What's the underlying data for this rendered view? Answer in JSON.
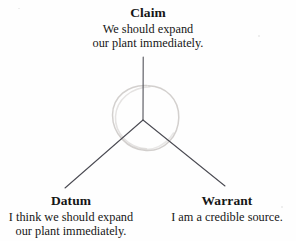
{
  "diagram": {
    "type": "three-branch-junction",
    "nodes": [
      {
        "id": "claim",
        "heading": "Claim",
        "body_lines": [
          "We should expand",
          "our plant immediately."
        ],
        "position": "top"
      },
      {
        "id": "datum",
        "heading": "Datum",
        "body_lines": [
          "I think we should expand",
          "our plant immediately."
        ],
        "position": "bottom-left"
      },
      {
        "id": "warrant",
        "heading": "Warrant",
        "body_lines": [
          "I am a credible source."
        ],
        "position": "bottom-right"
      }
    ],
    "junction": {
      "x": 143,
      "y": 120
    },
    "branches": [
      {
        "id": "claim-branch",
        "from": [
          143,
          120
        ],
        "to": [
          143,
          57
        ]
      },
      {
        "id": "datum-branch",
        "from": [
          143,
          120
        ],
        "to": [
          65,
          188
        ]
      },
      {
        "id": "warrant-branch",
        "from": [
          143,
          120
        ],
        "to": [
          225,
          186
        ]
      }
    ],
    "annotation_circle": {
      "id": "hand-drawn-circle",
      "center": [
        145,
        117
      ],
      "radius_x": 33,
      "radius_y": 32
    },
    "colors": {
      "background": "#fefefe",
      "text": "#161616",
      "line": "#4a4a52",
      "annotation": "#c9c6c4"
    }
  }
}
